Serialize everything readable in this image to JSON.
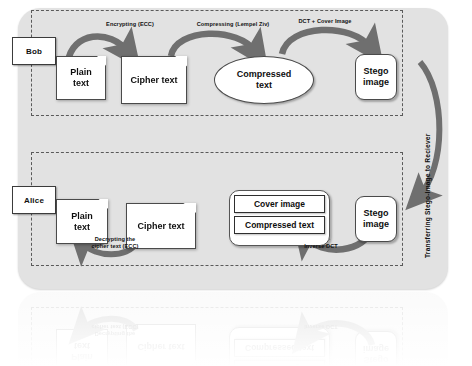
{
  "diagram": {
    "background_color": "#ffffff",
    "panel_color": "#e2e2e2",
    "arrow_color": "#6f6f6f",
    "node_fill": "#ffffff",
    "node_stroke": "#4a4a4a"
  },
  "sender_section": {
    "party_label": "Bob",
    "nodes": [
      {
        "id": "plain-text",
        "label": "Plain\ntext",
        "shape": "document"
      },
      {
        "id": "cipher-text",
        "label": "Cipher text",
        "shape": "document"
      },
      {
        "id": "compressed-text",
        "label": "Compressed\ntext",
        "shape": "ellipse"
      },
      {
        "id": "stego-image",
        "label": "Stego\nimage",
        "shape": "rounded-rect"
      }
    ],
    "arrows": [
      {
        "id": "encrypting",
        "label": "Encrypting (ECC)",
        "from": "plain-text",
        "to": "cipher-text"
      },
      {
        "id": "compressing",
        "label": "Compressing (Lempel Ziv)",
        "from": "cipher-text",
        "to": "compressed-text"
      },
      {
        "id": "embedding",
        "label": "DCT + Cover Image",
        "from": "compressed-text",
        "to": "stego-image"
      }
    ]
  },
  "transfer": {
    "label": "Transferring Stego-Image to Reciever",
    "direction": "down"
  },
  "receiver_section": {
    "party_label": "Alice",
    "nodes": [
      {
        "id": "plain-text-2",
        "label": "Plain\ntext",
        "shape": "document"
      },
      {
        "id": "cipher-text-2",
        "label": "Cipher text",
        "shape": "document"
      },
      {
        "id": "stego-image-2",
        "label": "Stego\nimage",
        "shape": "rounded-rect"
      }
    ],
    "extracted_stack": {
      "id": "extracted-contents",
      "items": [
        {
          "id": "cover-image",
          "label": "Cover image"
        },
        {
          "id": "compressed-text-2",
          "label": "Compressed text"
        }
      ]
    },
    "arrows": [
      {
        "id": "inverse-dct",
        "label": "Inverse DCT",
        "from": "stego-image-2",
        "to": "extracted-contents"
      },
      {
        "id": "decrypting",
        "label": "Decrypting the\ncipher text (ECC)",
        "from": "cipher-text-2",
        "to": "plain-text-2"
      }
    ]
  },
  "labels": {
    "encrypting": "Encrypting (ECC)",
    "compressing": "Compressing (Lempel Ziv)",
    "dct_cover": "DCT + Cover Image",
    "transfer": "Transferring Stego-Image to Reciever",
    "inverse_dct": "Inverse DCT",
    "decrypting_l1": "Decrypting the",
    "decrypting_l2": "cipher text (ECC)",
    "plain_l1": "Plain",
    "plain_l2": "text",
    "cipher": "Cipher text",
    "compressed_l1": "Compressed",
    "compressed_l2": "text",
    "stego_l1": "Stego",
    "stego_l2": "image",
    "cover_image": "Cover image",
    "compressed_text": "Compressed text",
    "bob": "Bob",
    "alice": "Alice"
  }
}
